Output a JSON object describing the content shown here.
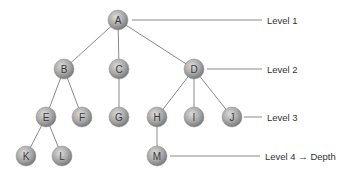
{
  "diagram": {
    "type": "tree",
    "nodes": [
      {
        "id": "A",
        "label": "A",
        "x": 118,
        "y": 20,
        "level": 1
      },
      {
        "id": "B",
        "label": "B",
        "x": 64,
        "y": 69,
        "level": 2
      },
      {
        "id": "C",
        "label": "C",
        "x": 119,
        "y": 69,
        "level": 2
      },
      {
        "id": "D",
        "label": "D",
        "x": 194,
        "y": 69,
        "level": 2
      },
      {
        "id": "E",
        "label": "E",
        "x": 46,
        "y": 117,
        "level": 3
      },
      {
        "id": "F",
        "label": "F",
        "x": 82,
        "y": 117,
        "level": 3
      },
      {
        "id": "G",
        "label": "G",
        "x": 119,
        "y": 117,
        "level": 3
      },
      {
        "id": "H",
        "label": "H",
        "x": 157,
        "y": 117,
        "level": 3
      },
      {
        "id": "I",
        "label": "I",
        "x": 194,
        "y": 117,
        "level": 3
      },
      {
        "id": "J",
        "label": "J",
        "x": 232,
        "y": 117,
        "level": 3
      },
      {
        "id": "K",
        "label": "K",
        "x": 26,
        "y": 156,
        "level": 4
      },
      {
        "id": "L",
        "label": "L",
        "x": 62,
        "y": 156,
        "level": 4
      },
      {
        "id": "M",
        "label": "M",
        "x": 157,
        "y": 156,
        "level": 4
      }
    ],
    "edges": [
      [
        "A",
        "B"
      ],
      [
        "A",
        "C"
      ],
      [
        "A",
        "D"
      ],
      [
        "B",
        "E"
      ],
      [
        "B",
        "F"
      ],
      [
        "C",
        "G"
      ],
      [
        "D",
        "H"
      ],
      [
        "D",
        "I"
      ],
      [
        "D",
        "J"
      ],
      [
        "E",
        "K"
      ],
      [
        "E",
        "L"
      ],
      [
        "H",
        "M"
      ]
    ],
    "levels": [
      {
        "label": "Level 1",
        "y": 20,
        "line_x1": 132,
        "line_x2": 262
      },
      {
        "label": "Level 2",
        "y": 69,
        "line_x1": 207,
        "line_x2": 262
      },
      {
        "label": "Level 3",
        "y": 117,
        "line_x1": 244,
        "line_x2": 262
      },
      {
        "label": "Level 4 → Depth",
        "y": 156,
        "line_x1": 170,
        "line_x2": 260
      }
    ],
    "colors": {
      "node_light": "#d8d8d8",
      "node_dark": "#7e7e7e",
      "edge": "#8a8a8a"
    }
  }
}
